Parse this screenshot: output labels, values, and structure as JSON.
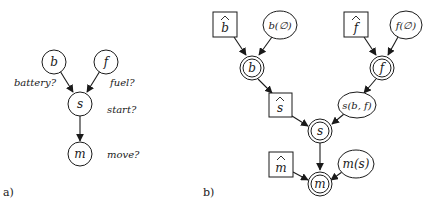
{
  "panels": {
    "a": {
      "label": "a)",
      "nodes": {
        "b": {
          "label": "b",
          "caption": "battery?"
        },
        "f": {
          "label": "f",
          "caption": "fuel?"
        },
        "s": {
          "label": "s",
          "caption": "start?"
        },
        "m": {
          "label": "m",
          "caption": "move?"
        }
      },
      "edges": [
        [
          "b",
          "s"
        ],
        [
          "f",
          "s"
        ],
        [
          "s",
          "m"
        ]
      ]
    },
    "b": {
      "label": "b)",
      "hat_nodes": {
        "b_hat": {
          "label": "b",
          "shape": "square-with-hat"
        },
        "f_hat": {
          "label": "f",
          "shape": "square-with-hat"
        },
        "s_hat": {
          "label": "s",
          "shape": "square-with-hat"
        },
        "m_hat": {
          "label": "m",
          "shape": "square-with-hat"
        }
      },
      "function_nodes": {
        "b_fn": {
          "label": "b(∅)",
          "shape": "ellipse"
        },
        "f_fn": {
          "label": "f(∅)",
          "shape": "ellipse"
        },
        "s_fn": {
          "label": "s(b, f)",
          "shape": "ellipse"
        },
        "m_fn": {
          "label": "m(s)",
          "shape": "ellipse"
        }
      },
      "variable_nodes": {
        "b": {
          "label": "b",
          "shape": "double-circle"
        },
        "f": {
          "label": "f",
          "shape": "double-circle"
        },
        "s": {
          "label": "s",
          "shape": "double-circle"
        },
        "m": {
          "label": "m",
          "shape": "double-circle"
        }
      },
      "edges": [
        [
          "b_hat",
          "b"
        ],
        [
          "b_fn",
          "b"
        ],
        [
          "f_hat",
          "f"
        ],
        [
          "f_fn",
          "f"
        ],
        [
          "b",
          "s_hat"
        ],
        [
          "f",
          "s_fn"
        ],
        [
          "s_hat",
          "s"
        ],
        [
          "s_fn",
          "s"
        ],
        [
          "s",
          "m"
        ],
        [
          "m_hat",
          "m"
        ],
        [
          "m_fn",
          "m"
        ]
      ]
    }
  }
}
